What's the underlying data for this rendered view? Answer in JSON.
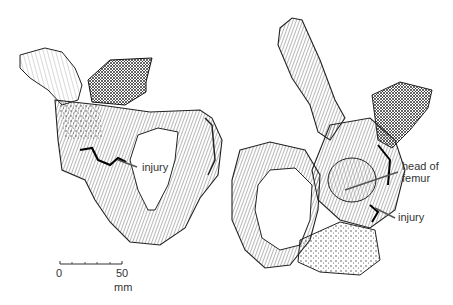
{
  "figure": {
    "left_specimen": {
      "labels": [
        {
          "text": "injury"
        }
      ]
    },
    "right_specimen": {
      "labels": [
        {
          "text": "head of"
        },
        {
          "text": "femur"
        },
        {
          "text": "injury"
        }
      ]
    },
    "scale_bar": {
      "start_label": "0",
      "end_label": "50",
      "unit": "mm"
    },
    "colors": {
      "background": "#ffffff",
      "ink": "#1a1a1a",
      "leader_line": "#555555",
      "label_text": "#333333"
    }
  }
}
